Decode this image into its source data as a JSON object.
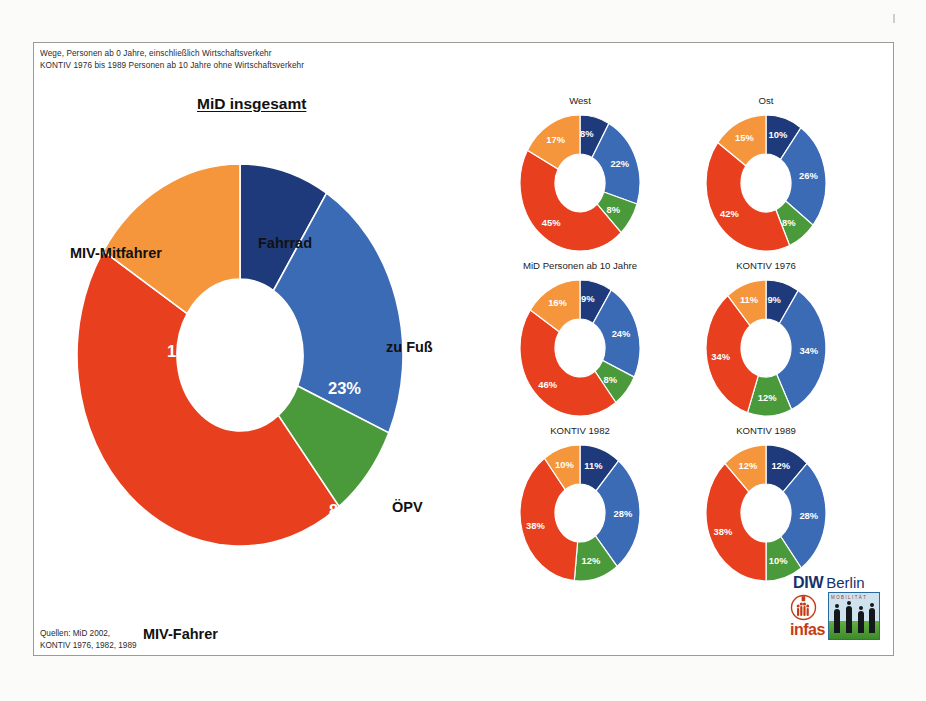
{
  "header": {
    "note_line1": "Wege, Personen ab 0 Jahre, einschließlich Wirtschaftsverkehr",
    "note_line2": "KONTIV 1976 bis 1989 Personen ab 10 Jahre ohne Wirtschaftsverkehr"
  },
  "source": {
    "line1": "Quellen: MiD 2002,",
    "line2": "KONTIV 1976, 1982, 1989"
  },
  "logo": {
    "diw": "DIW",
    "berlin": "Berlin",
    "infas": "infas",
    "photo_caption": "MOBILITÄT"
  },
  "palette": {
    "fahrrad": "#1F3A7A",
    "zu_fuss": "#3B6BB5",
    "oepv": "#4A9A3C",
    "miv_fahrer": "#E8401F",
    "miv_mitfahrer": "#F5963C"
  },
  "main_chart": {
    "title": "MiD insgesamt",
    "labels": {
      "fahrrad": "Fahrrad",
      "zu_fuss": "zu Fuß",
      "oepv": "ÖPV",
      "miv_fahrer": "MIV-Fahrer",
      "miv_mitfahrer": "MIV-Mitfahrer"
    },
    "values": {
      "fahrrad": "9%",
      "zu_fuss": "23%",
      "oepv": "8%",
      "miv_fahrer": "45%",
      "miv_mitfahrer": "16%"
    }
  },
  "small_charts": {
    "west": {
      "title": "West",
      "v": [
        "8%",
        "22%",
        "8%",
        "45%",
        "17%"
      ]
    },
    "ost": {
      "title": "Ost",
      "v": [
        "10%",
        "26%",
        "8%",
        "42%",
        "15%"
      ]
    },
    "mid10": {
      "title": "MiD Personen ab 10 Jahre",
      "v": [
        "9%",
        "24%",
        "8%",
        "46%",
        "16%"
      ]
    },
    "kontiv76": {
      "title": "KONTIV 1976",
      "v": [
        "9%",
        "34%",
        "12%",
        "34%",
        "11%"
      ]
    },
    "kontiv82": {
      "title": "KONTIV 1982",
      "v": [
        "11%",
        "28%",
        "12%",
        "38%",
        "10%"
      ]
    },
    "kontiv89": {
      "title": "KONTIV 1989",
      "v": [
        "12%",
        "28%",
        "10%",
        "38%",
        "12%"
      ]
    }
  },
  "chart_data": {
    "type": "pie",
    "subtitle": "Wege, Personen ab 0 Jahre, einschließlich Wirtschaftsverkehr",
    "legend_position": "labels-around-main-donut",
    "grid": false,
    "categories": [
      "Fahrrad",
      "zu Fuß",
      "ÖPV",
      "MIV-Fahrer",
      "MIV-Mitfahrer"
    ],
    "colors": [
      "#1F3A7A",
      "#3B6BB5",
      "#4A9A3C",
      "#E8401F",
      "#F5963C"
    ],
    "unit": "%",
    "series": [
      {
        "name": "MiD insgesamt",
        "values": [
          9,
          23,
          8,
          45,
          16
        ]
      },
      {
        "name": "West",
        "values": [
          8,
          22,
          8,
          45,
          17
        ]
      },
      {
        "name": "Ost",
        "values": [
          10,
          26,
          8,
          42,
          15
        ]
      },
      {
        "name": "MiD Personen ab 10 Jahre",
        "values": [
          9,
          24,
          8,
          46,
          16
        ]
      },
      {
        "name": "KONTIV 1976",
        "values": [
          9,
          34,
          12,
          34,
          11
        ]
      },
      {
        "name": "KONTIV 1982",
        "values": [
          11,
          28,
          12,
          38,
          10
        ]
      },
      {
        "name": "KONTIV 1989",
        "values": [
          12,
          28,
          10,
          38,
          12
        ]
      }
    ]
  }
}
